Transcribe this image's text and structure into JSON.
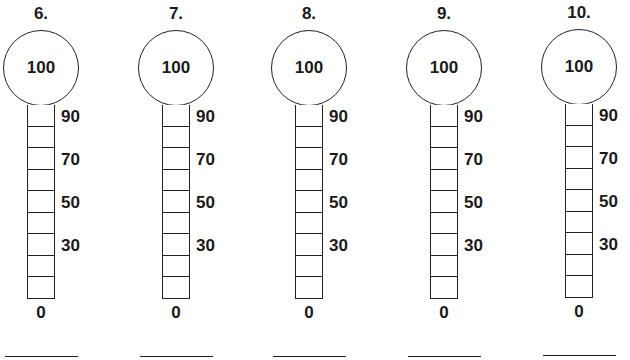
{
  "worksheet": {
    "problems": [
      {
        "number": "6.",
        "top_value": "100",
        "bottom_value": "0",
        "answer": "",
        "ticks": [
          "90",
          "70",
          "50",
          "30"
        ]
      },
      {
        "number": "7.",
        "top_value": "100",
        "bottom_value": "0",
        "answer": "",
        "ticks": [
          "90",
          "70",
          "50",
          "30"
        ]
      },
      {
        "number": "8.",
        "top_value": "100",
        "bottom_value": "0",
        "answer": "",
        "ticks": [
          "90",
          "70",
          "50",
          "30"
        ]
      },
      {
        "number": "9.",
        "top_value": "100",
        "bottom_value": "0",
        "answer": "",
        "ticks": [
          "90",
          "70",
          "50",
          "30"
        ]
      },
      {
        "number": "10.",
        "top_value": "100",
        "bottom_value": "0",
        "answer": "",
        "ticks": [
          "90",
          "70",
          "50",
          "30"
        ]
      }
    ],
    "cells_per_tube": 9,
    "line_color": "#222222",
    "background": "#ffffff"
  }
}
